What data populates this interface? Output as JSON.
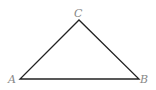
{
  "diagram": {
    "type": "triangle",
    "stroke_color": "#222222",
    "label_color": "#888888",
    "vertices": [
      {
        "label": "A",
        "x": 20,
        "y": 79
      },
      {
        "label": "B",
        "x": 139,
        "y": 79
      },
      {
        "label": "C",
        "x": 79,
        "y": 20
      }
    ]
  }
}
